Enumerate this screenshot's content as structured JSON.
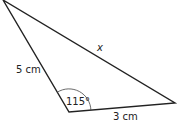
{
  "diagram": {
    "type": "triangle",
    "vertices": {
      "top": [
        3,
        0
      ],
      "bottom": [
        69,
        112
      ],
      "right": [
        175,
        103
      ]
    },
    "sides": [
      {
        "name": "left",
        "label": "5 cm"
      },
      {
        "name": "bottom",
        "label": "3 cm"
      },
      {
        "name": "hypotenuse",
        "label": "x"
      }
    ],
    "angle": {
      "vertex": "bottom",
      "label": "115°"
    },
    "colors": {
      "stroke": "#222222",
      "text": "#222222"
    }
  }
}
